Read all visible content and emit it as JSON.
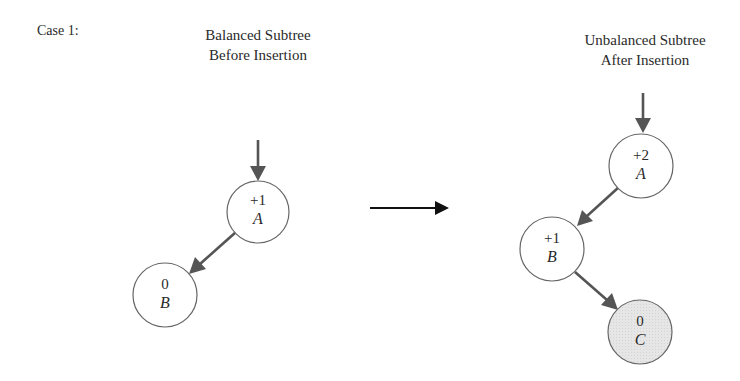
{
  "case_label": "Case 1:",
  "left_panel": {
    "heading_line1": "Balanced Subtree",
    "heading_line2": "Before Insertion",
    "nodes": [
      {
        "id": "A",
        "balance": "+1",
        "label": "A",
        "highlighted": false
      },
      {
        "id": "B",
        "balance": "0",
        "label": "B",
        "highlighted": false
      }
    ],
    "edges": [
      {
        "from": "parent",
        "to": "A"
      },
      {
        "from": "A",
        "to": "B",
        "side": "left"
      }
    ]
  },
  "transition": {
    "icon": "right-arrow-icon",
    "meaning": "after insertion"
  },
  "right_panel": {
    "heading_line1": "Unbalanced Subtree",
    "heading_line2": "After Insertion",
    "nodes": [
      {
        "id": "A",
        "balance": "+2",
        "label": "A",
        "highlighted": false
      },
      {
        "id": "B",
        "balance": "+1",
        "label": "B",
        "highlighted": false
      },
      {
        "id": "C",
        "balance": "0",
        "label": "C",
        "highlighted": true
      }
    ],
    "edges": [
      {
        "from": "parent",
        "to": "A"
      },
      {
        "from": "A",
        "to": "B",
        "side": "left"
      },
      {
        "from": "B",
        "to": "C",
        "side": "right"
      }
    ]
  },
  "colors": {
    "node_stroke": "#666666",
    "node_fill": "#ffffff",
    "inserted_node_fill": "#e4e4e4",
    "edge": "#555555",
    "transition_arrow": "#111111",
    "text": "#2a2a2a"
  }
}
